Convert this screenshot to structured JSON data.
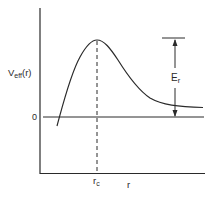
{
  "diagram": {
    "y_axis_label": {
      "main": "V",
      "subscript": "eff",
      "suffix": "(r)"
    },
    "x_axis_label": "r",
    "zero_label": "0",
    "peak_label": {
      "main": "r",
      "subscript": "c"
    },
    "energy_label": {
      "main": "E",
      "subscript": "r"
    },
    "colors": {
      "line": "#2a2a2a",
      "background": "#ffffff"
    }
  }
}
